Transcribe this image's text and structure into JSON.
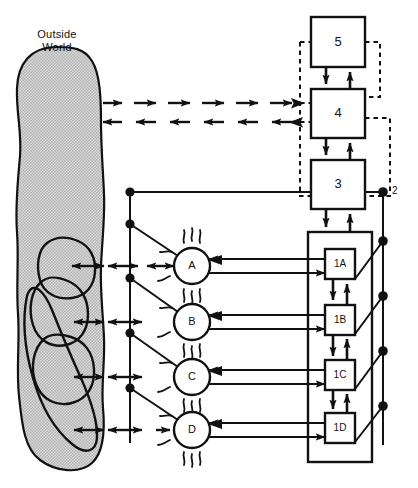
{
  "diagram": {
    "type": "block-diagram",
    "colors": {
      "stroke": "#111111",
      "background": "#ffffff",
      "amoeba_fill": "#d2d2d2",
      "amoeba_stroke": "#111111",
      "dashed_stroke": "#111111"
    },
    "outside_world": {
      "label_line1": "Outside",
      "label_line2": "World",
      "label": "Outside World",
      "inner_blob_count": 4
    },
    "levels": [
      {
        "id": "5",
        "label": "5",
        "x": 311,
        "y": 17,
        "w": 54,
        "h": 50
      },
      {
        "id": "4",
        "label": "4",
        "x": 311,
        "y": 89,
        "w": 54,
        "h": 49
      },
      {
        "id": "3",
        "label": "3",
        "x": 311,
        "y": 160,
        "w": 54,
        "h": 49
      }
    ],
    "bus_label": "2",
    "container": {
      "x": 308,
      "y": 232,
      "w": 64,
      "h": 230
    },
    "units": [
      {
        "id": "1A",
        "label": "1A",
        "y": 266
      },
      {
        "id": "1B",
        "label": "1B",
        "y": 322
      },
      {
        "id": "1C",
        "label": "1C",
        "y": 377
      },
      {
        "id": "1D",
        "label": "1D",
        "y": 430
      }
    ],
    "nodes": [
      {
        "id": "A",
        "label": "A",
        "cx": 192,
        "cy": 266
      },
      {
        "id": "B",
        "label": "B",
        "cx": 192,
        "cy": 322
      },
      {
        "id": "C",
        "label": "C",
        "cx": 192,
        "cy": 377
      },
      {
        "id": "D",
        "label": "D",
        "cx": 192,
        "cy": 430
      }
    ],
    "left_bus_x": 130,
    "right_bus_x": 383,
    "dashed_rows": {
      "top_row_y": 103,
      "top_row_direction": "right",
      "bottom_row_y": 122,
      "bottom_row_direction": "left",
      "arrow_count": 6
    }
  }
}
